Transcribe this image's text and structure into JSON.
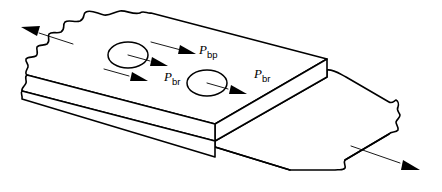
{
  "figure": {
    "background_color": "#ffffff",
    "line_color": "#000000",
    "plates": [
      {
        "name": "upper-plate",
        "description": "Front plate with two bolt holes, torn break edge at upper left"
      },
      {
        "name": "lower-plate",
        "description": "Rear lapped plate extending to lower right, torn break edge at right end"
      }
    ],
    "holes": [
      {
        "name": "bolt-hole-left",
        "cx": 128,
        "cy": 55,
        "rx": 20,
        "ry": 13
      },
      {
        "name": "bolt-hole-right",
        "cx": 207,
        "cy": 83,
        "rx": 20,
        "ry": 13
      }
    ],
    "labels": {
      "bp": {
        "symbol": "P",
        "subscript": "bp"
      },
      "br_left": {
        "symbol": "P",
        "subscript": "br"
      },
      "br_right": {
        "symbol": "P",
        "subscript": "br"
      }
    },
    "external_forces": [
      {
        "name": "tension-arrow-upper-left",
        "direction": "up-left"
      },
      {
        "name": "tension-arrow-lower-right",
        "direction": "down-right"
      }
    ]
  }
}
